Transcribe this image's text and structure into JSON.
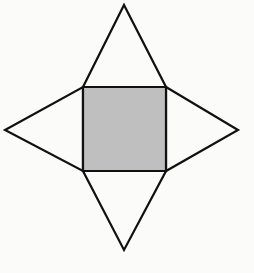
{
  "figure": {
    "name": "four-pointed-star-net",
    "title": "Four-pointed star / square with four triangular flaps",
    "canvas": {
      "width": 254,
      "height": 273,
      "background_color": "#fbfbfa"
    },
    "style": {
      "stroke_color": "#111111",
      "stroke_width": 2.2,
      "square_fill": "#bfbfbf",
      "triangle_fill": "#fbfbfa",
      "line_join": "miter"
    },
    "shapes": [
      {
        "name": "center-square",
        "type": "square",
        "fill": "#bfbfbf",
        "stroke": "#111111",
        "points": [
          [
            83,
            87
          ],
          [
            166,
            87
          ],
          [
            166,
            171
          ],
          [
            83,
            171
          ]
        ],
        "side_length": 84,
        "center": [
          124.5,
          129
        ]
      },
      {
        "name": "top-triangle",
        "type": "triangle",
        "fill": "#fbfbfa",
        "stroke": "#111111",
        "points": [
          [
            83,
            87
          ],
          [
            166,
            87
          ],
          [
            124,
            5
          ]
        ],
        "apex": [
          124,
          5
        ],
        "base_edge": "top"
      },
      {
        "name": "right-triangle",
        "type": "triangle",
        "fill": "#fbfbfa",
        "stroke": "#111111",
        "points": [
          [
            166,
            87
          ],
          [
            166,
            171
          ],
          [
            238,
            130
          ]
        ],
        "apex": [
          238,
          130
        ],
        "base_edge": "right"
      },
      {
        "name": "bottom-triangle",
        "type": "triangle",
        "fill": "#fbfbfa",
        "stroke": "#111111",
        "points": [
          [
            166,
            171
          ],
          [
            83,
            171
          ],
          [
            124,
            250
          ]
        ],
        "apex": [
          124,
          250
        ],
        "base_edge": "bottom"
      },
      {
        "name": "left-triangle",
        "type": "triangle",
        "fill": "#fbfbfa",
        "stroke": "#111111",
        "points": [
          [
            83,
            171
          ],
          [
            83,
            87
          ],
          [
            5,
            130
          ]
        ],
        "apex": [
          5,
          130
        ],
        "base_edge": "left"
      }
    ],
    "labels": [],
    "point_count": 4
  }
}
